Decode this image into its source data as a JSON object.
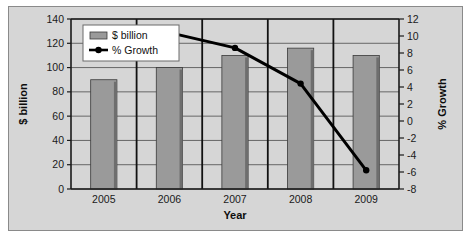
{
  "chart_data": {
    "type": "bar",
    "title": "",
    "categories": [
      "2005",
      "2006",
      "2007",
      "2008",
      "2009"
    ],
    "xlabel": "Year",
    "ylabel": "$ billion",
    "y2label": "% Growth",
    "ylim": [
      0,
      140
    ],
    "y2lim": [
      -8,
      12
    ],
    "yticks": [
      "0",
      "20",
      "40",
      "60",
      "80",
      "100",
      "120",
      "140"
    ],
    "y2ticks": [
      "-8",
      "-6",
      "-4",
      "-2",
      "0",
      "2",
      "4",
      "6",
      "8",
      "10",
      "12"
    ],
    "grid": true,
    "legend_position": "top-left",
    "series": [
      {
        "name": "$ billion",
        "type": "bar",
        "axis": "left",
        "color": "#9a9a9a",
        "values": [
          90,
          100,
          110,
          116,
          110
        ]
      },
      {
        "name": "% Growth",
        "type": "line",
        "axis": "right",
        "color": "#000000",
        "x": [
          "2006",
          "2007",
          "2008",
          "2009"
        ],
        "values": [
          10.4,
          8.6,
          4.4,
          -5.8
        ]
      }
    ]
  },
  "legend": {
    "items": [
      {
        "label": "$ billion",
        "marker": "bar-swatch"
      },
      {
        "label": "% Growth",
        "marker": "line-with-dot"
      }
    ]
  },
  "axes": {
    "left_title": "$ billion",
    "right_title": "% Growth",
    "bottom_title": "Year"
  }
}
